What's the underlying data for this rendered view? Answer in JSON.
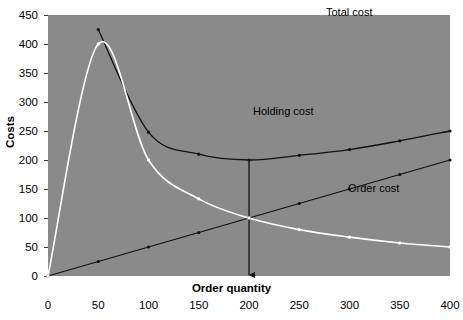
{
  "chart_data": {
    "type": "line",
    "title": "",
    "xlabel": "Order quantity",
    "ylabel": "Costs",
    "xlim": [
      0,
      400
    ],
    "ylim": [
      0,
      450
    ],
    "xticks": [
      0,
      50,
      100,
      150,
      200,
      250,
      300,
      350,
      400
    ],
    "yticks": [
      0,
      50,
      100,
      150,
      200,
      250,
      300,
      350,
      400,
      450
    ],
    "grid": false,
    "legend_position": "inline-annotations",
    "plot_background": "#8a8a8a",
    "series": [
      {
        "name": "Total cost",
        "color": "#111111",
        "marker": "dot",
        "x": [
          50,
          100,
          150,
          200,
          250,
          300,
          350,
          400
        ],
        "values": [
          425,
          248,
          210,
          200,
          208,
          218,
          233,
          250
        ]
      },
      {
        "name": "Holding cost",
        "color": "#111111",
        "marker": "dot",
        "x": [
          0,
          50,
          100,
          150,
          200,
          250,
          300,
          350,
          400
        ],
        "values": [
          0,
          25,
          50,
          75,
          100,
          125,
          150,
          175,
          200
        ]
      },
      {
        "name": "Order cost",
        "color": "#ffffff",
        "marker": "dot",
        "x": [
          0,
          50,
          100,
          150,
          200,
          250,
          300,
          350,
          400
        ],
        "values": [
          0,
          400,
          200,
          133,
          100,
          80,
          67,
          57,
          50
        ]
      }
    ],
    "annotations": [
      {
        "name": "total-cost",
        "text": "Total cost",
        "x": 290,
        "y": 268
      },
      {
        "name": "holding-cost",
        "text": "Holding cost",
        "x": 212,
        "y": 178
      },
      {
        "name": "order-cost",
        "text": "Order cost",
        "x": 310,
        "y": 88
      }
    ],
    "markers": [
      {
        "name": "eoq-indicator",
        "type": "vertical-arrow",
        "x": 200,
        "y_top": 200,
        "y_bottom": 0
      }
    ]
  }
}
